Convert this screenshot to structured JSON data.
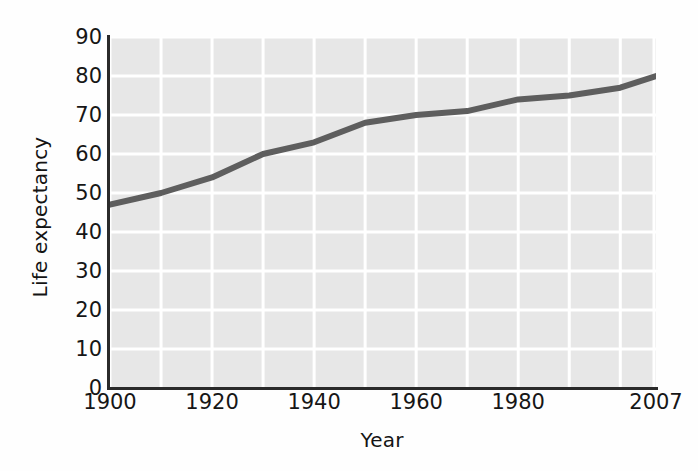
{
  "chart_data": {
    "type": "line",
    "title": "",
    "xlabel": "Year",
    "ylabel": "Life expectancy",
    "xlim": [
      1900,
      2007
    ],
    "ylim": [
      0,
      90
    ],
    "xticks": [
      1900,
      1920,
      1940,
      1960,
      1980,
      2007
    ],
    "xtick_labels": [
      "1900",
      "1920",
      "1940",
      "1960",
      "1980",
      "2007"
    ],
    "yticks": [
      0,
      10,
      20,
      30,
      40,
      50,
      60,
      70,
      80,
      90
    ],
    "ytick_labels": [
      "0",
      "10",
      "20",
      "30",
      "40",
      "50",
      "60",
      "70",
      "80",
      "90"
    ],
    "grid": true,
    "grid_color": "#ffffff",
    "plot_background": "#e7e7e7",
    "legend": null,
    "series": [
      {
        "name": "Life expectancy",
        "color": "#5e5e5e",
        "line_width": 6,
        "x": [
          1900,
          1910,
          1920,
          1930,
          1940,
          1950,
          1960,
          1970,
          1980,
          1990,
          2000,
          2007
        ],
        "values": [
          47,
          50,
          54,
          60,
          63,
          68,
          70,
          71,
          74,
          75,
          77,
          80
        ]
      }
    ]
  },
  "axes": {
    "ylabel": "Life expectancy",
    "xlabel": "Year"
  }
}
